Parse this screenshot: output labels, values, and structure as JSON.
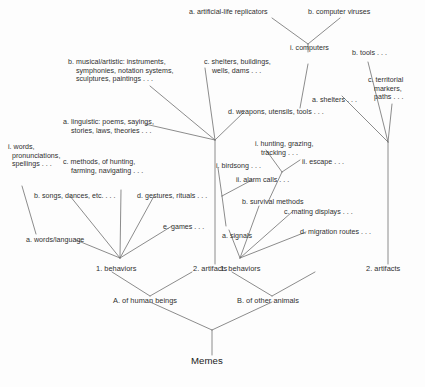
{
  "diagram": {
    "title": "Memes",
    "type": "hierarchical-taxonomy-tree",
    "root": {
      "label": "Memes"
    },
    "tier_categories": [
      {
        "key": "human",
        "label": "A. of human beings"
      },
      {
        "key": "animal",
        "label": "B. of other animals"
      }
    ],
    "tier_main": [
      {
        "key": "human-behaviors",
        "label": "1. behaviors"
      },
      {
        "key": "human-artifacts",
        "label": "2. artifacts"
      },
      {
        "key": "animal-behaviors",
        "label": "1. behaviors"
      },
      {
        "key": "animal-artifacts",
        "label": "2. artifacts"
      }
    ],
    "human_behaviors_children": [
      {
        "key": "words-language",
        "label": "a. words/language"
      },
      {
        "key": "songs-dances",
        "label": "b. songs, dances, etc. . . ."
      },
      {
        "key": "methods",
        "label": "c. methods, of hunting,\n    farming, navigating . . ."
      },
      {
        "key": "gestures",
        "label": "d. gestures, rituals . . ."
      },
      {
        "key": "games",
        "label": "e. games . . ."
      }
    ],
    "words_language_children": [
      {
        "key": "words-pron-spell",
        "label": "i. words,\n  pronunciations,\n  spellings . . ."
      }
    ],
    "human_artifacts_children": [
      {
        "key": "linguistic",
        "label": "a. linguistic: poems, sayings,\n    stories, laws, theories . . ."
      },
      {
        "key": "musical",
        "label": "b. musical/artistic: instruments,\n    symphonies, notation systems,\n    sculptures, paintings . . ."
      },
      {
        "key": "shelters",
        "label": "c. shelters, buildings,\n    wells, dams . . ."
      },
      {
        "key": "weapons",
        "label": "d. weapons, utensils, tools . . ."
      }
    ],
    "weapons_children": [
      {
        "key": "computers",
        "label": "i. computers"
      }
    ],
    "computers_children": [
      {
        "key": "artificial-life",
        "label": "a. artificial-life replicators"
      },
      {
        "key": "computer-viruses",
        "label": "b. computer viruses"
      }
    ],
    "animal_behaviors_children": [
      {
        "key": "signals",
        "label": "a. signals"
      },
      {
        "key": "survival-methods",
        "label": "b. survival methods"
      },
      {
        "key": "mating-displays",
        "label": "c. mating displays . . ."
      },
      {
        "key": "migration-routes",
        "label": "d. migration routes . . ."
      }
    ],
    "signals_children": [
      {
        "key": "birdsong",
        "label": "i. birdsong . . ."
      },
      {
        "key": "alarm-calls",
        "label": "ii. alarm calls . . ."
      }
    ],
    "survival_children": [
      {
        "key": "hunting-grazing",
        "label": "i. hunting, grazing,\n   tracking . . ."
      },
      {
        "key": "escape",
        "label": "ii. escape . . ."
      }
    ],
    "animal_artifacts_children": [
      {
        "key": "animal-shelters",
        "label": "a. shelters . . ."
      },
      {
        "key": "animal-tools",
        "label": "b. tools . . ."
      },
      {
        "key": "territorial-markers",
        "label": "c. territorial\n   markers,\n   paths . . ."
      }
    ],
    "colors": {
      "line": "#6f6f6f",
      "text": "#2f2f2f",
      "background": "#fdfdfd"
    }
  }
}
